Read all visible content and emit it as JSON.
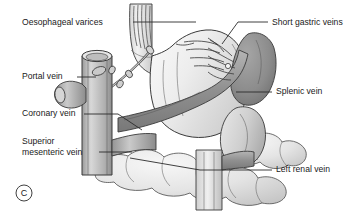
{
  "figure": {
    "panel_letter": "C",
    "title_visible": false
  },
  "labels": [
    {
      "id": "oesophageal-varices",
      "text": "Oesophageal varices",
      "position": "top-left"
    },
    {
      "id": "portal-vein",
      "text": "Portal vein",
      "position": "middle-left"
    },
    {
      "id": "coronary-vein",
      "text": "Coronary vein",
      "position": "lower-left"
    },
    {
      "id": "superior-mesenteric-vein",
      "text_line1": "Superior",
      "text_line2": "mesenteric vein",
      "position": "bottom-left"
    },
    {
      "id": "short-gastric-veins",
      "text": "Short gastric veins",
      "position": "top-right"
    },
    {
      "id": "splenic-vein",
      "text": "Splenic vein",
      "position": "middle-right"
    },
    {
      "id": "left-renal-vein",
      "text": "Left renal vein",
      "position": "bottom-right"
    }
  ],
  "colors": {
    "background": "#ffffff",
    "ink": "#1a1a1a",
    "leader_line": "#2b2b2b",
    "outline": "#3a3a3a",
    "stomach_light": "#f0f0f0",
    "stomach_mid": "#d8d8d8",
    "oesophagus": "#e0e0e0",
    "vein_light": "#c8c8c8",
    "vein_mid": "#a8a8a8",
    "vein_dark": "#8a8a8a",
    "spleen": "#909090",
    "spleen_dark": "#787878",
    "bowel_light": "#ebebeb",
    "bowel_shade": "#d0d0d0",
    "kidney": "#b8b8b8"
  }
}
